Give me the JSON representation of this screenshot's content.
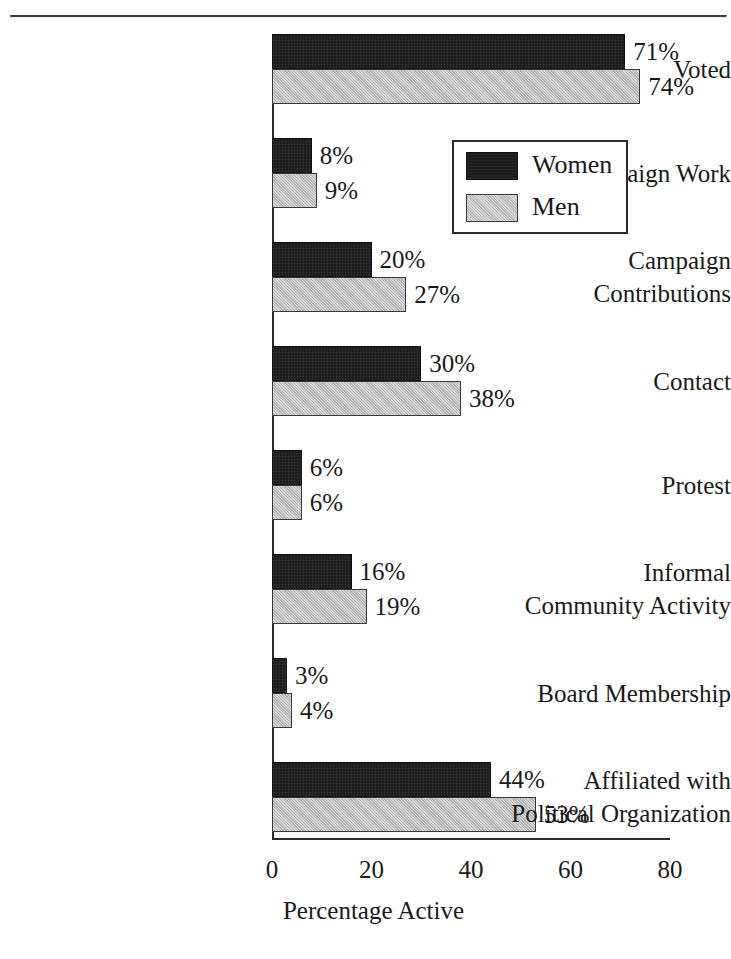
{
  "chart_data": {
    "type": "bar",
    "orientation": "horizontal",
    "title": "",
    "xlabel": "Percentage Active",
    "ylabel": "",
    "xlim": [
      0,
      80
    ],
    "xticks": [
      0,
      20,
      40,
      60,
      80
    ],
    "xtick_labels": [
      "0",
      "20",
      "40",
      "60",
      "80"
    ],
    "grid": false,
    "legend_position": "upper right",
    "value_label_suffix": "%",
    "categories": [
      "Voted",
      "Campaign Work",
      "Campaign\nContributions",
      "Contact",
      "Protest",
      "Informal\nCommunity Activity",
      "Board Membership",
      "Affiliated with\nPolitical Organization"
    ],
    "series": [
      {
        "name": "Women",
        "color": "#1c1c1c",
        "values": [
          71,
          8,
          20,
          30,
          6,
          16,
          3,
          44
        ],
        "value_labels": [
          "71%",
          "8%",
          "20%",
          "30%",
          "6%",
          "16%",
          "3%",
          "44%"
        ]
      },
      {
        "name": "Men",
        "color": "#b9b9b9",
        "values": [
          74,
          9,
          27,
          38,
          6,
          19,
          4,
          53
        ],
        "value_labels": [
          "74%",
          "9%",
          "27%",
          "38%",
          "6%",
          "19%",
          "4%",
          "53%"
        ]
      }
    ],
    "legend": [
      {
        "label": "Women",
        "swatch": "#1c1c1c"
      },
      {
        "label": "Men",
        "swatch": "#b9b9b9"
      }
    ]
  },
  "page": {
    "rule_color": "#3c3c3c",
    "axis_color": "#2b2b2b",
    "background": "#ffffff"
  }
}
